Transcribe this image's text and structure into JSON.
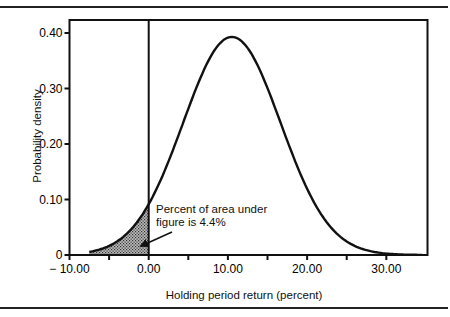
{
  "chart_data": {
    "type": "area",
    "title": "",
    "xlabel": "Holding period return (percent)",
    "ylabel": "Probability density",
    "xlim": [
      -10,
      35.2
    ],
    "ylim": [
      0,
      0.42
    ],
    "x_ticks": [
      -10,
      -5,
      0,
      5,
      10,
      15,
      20,
      25,
      30
    ],
    "x_tick_labels": [
      "− 10.00",
      "",
      "0.00",
      "",
      "10.00",
      "",
      "20.00",
      "",
      "30.00"
    ],
    "y_ticks": [
      0,
      0.1,
      0.2,
      0.3,
      0.4
    ],
    "y_tick_labels": [
      "0",
      "0.10",
      "0.20",
      "0.30",
      "0.40"
    ],
    "grid": false,
    "series": [
      {
        "name": "Normal distribution of holding period return",
        "distribution": "normal",
        "mean": 10.5,
        "std": 6.15,
        "peak_density": 0.393,
        "x": [
          -10,
          -5,
          0,
          5,
          10,
          10.5,
          15,
          20,
          25,
          30,
          35
        ],
        "values": [
          0.002,
          0.016,
          0.092,
          0.265,
          0.392,
          0.393,
          0.3,
          0.12,
          0.025,
          0.005,
          0.0
        ]
      }
    ],
    "shaded_region": {
      "from": -10,
      "to": 0,
      "pattern": "stippled",
      "area_percent": 4.4
    },
    "vertical_line": {
      "x": 0
    },
    "annotations": [
      {
        "text": "Percent of area under figure is 4.4%",
        "points_to": [
          -1.5,
          0.02
        ]
      }
    ]
  },
  "annotation": {
    "line1": "Percent of area under",
    "line2": "figure is 4.4%"
  },
  "axes": {
    "xlabel": "Holding period return (percent)",
    "ylabel": "Probability density"
  }
}
